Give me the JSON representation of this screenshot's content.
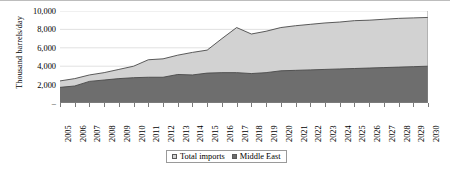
{
  "chart_data": {
    "type": "area",
    "title": "",
    "subtitle": "",
    "xlabel": "",
    "ylabel": "Thousand barrels/day",
    "stacked": true,
    "grid": true,
    "legend_position": "bottom",
    "ylim": [
      0,
      10000
    ],
    "ytick_step": 2000,
    "ytick_labels": [
      "10,000",
      "8,000",
      "6,000",
      "4,000",
      "2,000",
      "–"
    ],
    "ytick_values": [
      10000,
      8000,
      6000,
      4000,
      2000,
      0
    ],
    "categories": [
      "2005",
      "2006",
      "2007",
      "2008",
      "2009",
      "2010",
      "2011",
      "2012",
      "2013",
      "2014",
      "2015",
      "2016",
      "2017",
      "2018",
      "2019",
      "2020",
      "2021",
      "2022",
      "2023",
      "2024",
      "2025",
      "2026",
      "2027",
      "2028",
      "2029",
      "2030"
    ],
    "series": [
      {
        "name": "Total imports",
        "color": "#d2d2d2",
        "values": [
          2400,
          2650,
          3050,
          3300,
          3650,
          4000,
          4700,
          4800,
          5200,
          5500,
          5750,
          7000,
          8200,
          7500,
          7800,
          8200,
          8400,
          8550,
          8700,
          8800,
          8950,
          9000,
          9100,
          9200,
          9250,
          9300
        ]
      },
      {
        "name": "Middle East",
        "color": "#6e6e6e",
        "values": [
          1700,
          1850,
          2350,
          2500,
          2650,
          2750,
          2800,
          2800,
          3100,
          3050,
          3250,
          3300,
          3300,
          3200,
          3300,
          3500,
          3550,
          3600,
          3650,
          3700,
          3750,
          3800,
          3850,
          3900,
          3950,
          4000
        ]
      }
    ]
  },
  "legend": {
    "items": [
      {
        "label": "Total imports",
        "swatch": "#d2d2d2"
      },
      {
        "label": "Middle East",
        "swatch": "#6e6e6e"
      }
    ]
  }
}
